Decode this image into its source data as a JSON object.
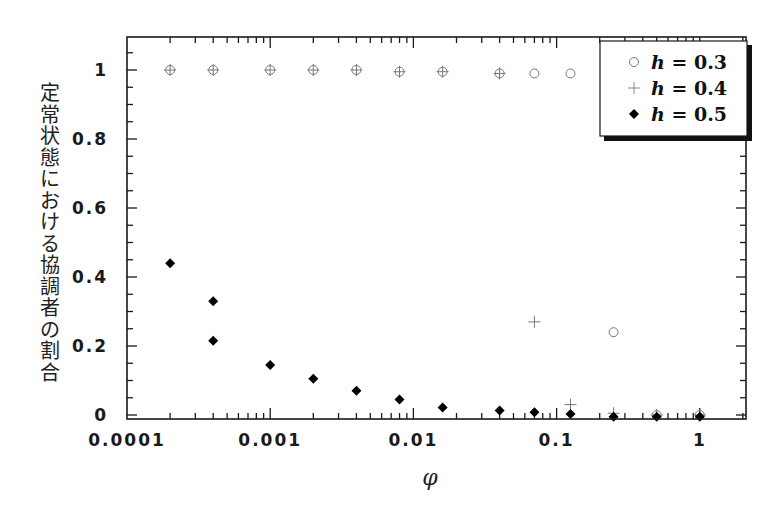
{
  "chart_data": {
    "type": "scatter",
    "title": "",
    "xlabel": "φ",
    "ylabel": "定常状態における協調者の割合",
    "x_scale": "log",
    "xlim": [
      0.0001,
      2
    ],
    "ylim": [
      0,
      1.1
    ],
    "x_ticks": [
      {
        "value": 0.0001,
        "label": "0.0001"
      },
      {
        "value": 0.001,
        "label": "0.001"
      },
      {
        "value": 0.01,
        "label": "0.01"
      },
      {
        "value": 0.1,
        "label": "0.1"
      },
      {
        "value": 1,
        "label": "1"
      }
    ],
    "y_ticks": [
      {
        "value": 0,
        "label": "0"
      },
      {
        "value": 0.2,
        "label": "0.2"
      },
      {
        "value": 0.4,
        "label": "0.4"
      },
      {
        "value": 0.6,
        "label": "0.6"
      },
      {
        "value": 0.8,
        "label": "0.8"
      },
      {
        "value": 1,
        "label": "1"
      }
    ],
    "grid": false,
    "legend_position": "upper right",
    "series": [
      {
        "name": "h = 0.3",
        "marker": "open-circle",
        "color": "#777777",
        "points": [
          [
            0.0002,
            1.0
          ],
          [
            0.0004,
            1.0
          ],
          [
            0.001,
            1.0
          ],
          [
            0.002,
            1.0
          ],
          [
            0.004,
            1.0
          ],
          [
            0.008,
            0.995
          ],
          [
            0.016,
            0.995
          ],
          [
            0.04,
            0.99
          ],
          [
            0.07,
            0.99
          ],
          [
            0.125,
            0.99
          ],
          [
            0.25,
            0.24
          ],
          [
            0.5,
            0.0
          ],
          [
            1.0,
            0.0
          ]
        ]
      },
      {
        "name": "h = 0.4",
        "marker": "plus",
        "color": "#777777",
        "points": [
          [
            0.0002,
            1.0
          ],
          [
            0.0004,
            1.0
          ],
          [
            0.001,
            1.0
          ],
          [
            0.002,
            1.0
          ],
          [
            0.004,
            1.0
          ],
          [
            0.008,
            0.995
          ],
          [
            0.016,
            0.995
          ],
          [
            0.04,
            0.99
          ],
          [
            0.07,
            0.27
          ],
          [
            0.125,
            0.03
          ],
          [
            0.25,
            0.005
          ],
          [
            0.5,
            0.0
          ],
          [
            1.0,
            0.0
          ]
        ]
      },
      {
        "name": "h = 0.5",
        "marker": "filled-diamond",
        "color": "#000000",
        "points": [
          [
            0.0002,
            0.44
          ],
          [
            0.0004,
            0.33
          ],
          [
            0.0004,
            0.215
          ],
          [
            0.001,
            0.145
          ],
          [
            0.002,
            0.105
          ],
          [
            0.004,
            0.07
          ],
          [
            0.008,
            0.045
          ],
          [
            0.016,
            0.022
          ],
          [
            0.04,
            0.013
          ],
          [
            0.07,
            0.008
          ],
          [
            0.125,
            0.003
          ],
          [
            0.25,
            -0.005
          ],
          [
            0.5,
            -0.005
          ],
          [
            1.0,
            -0.005
          ]
        ]
      }
    ]
  },
  "legend": {
    "items": [
      {
        "var": "h",
        "rest": " = 0.3"
      },
      {
        "var": "h",
        "rest": " = 0.4"
      },
      {
        "var": "h",
        "rest": " = 0.5"
      }
    ]
  },
  "axes": {
    "xlabel": "φ",
    "ylabel_chars": [
      "定",
      "常",
      "状",
      "態",
      "に",
      "お",
      "け",
      "る",
      "協",
      "調",
      "者",
      "の",
      "割",
      "合"
    ]
  }
}
